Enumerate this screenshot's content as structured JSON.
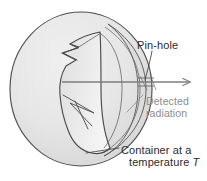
{
  "figure": {
    "kind": "cavity-radiator-blackbody-diagram",
    "width": 207,
    "height": 181,
    "background_color": "#ffffff"
  },
  "labels": {
    "pinhole": "Pin-hole",
    "detected_line1": "Detected",
    "detected_line2": "radiation",
    "container_line1": "Container at a",
    "container_line2_prefix": "temperature ",
    "container_line2_symbol": "T"
  },
  "colors": {
    "sphere_fill": "#e3e3e3",
    "sphere_fill_light": "#ededed",
    "cavity_fill": "#f2f2f2",
    "outline": "#4a4a4a",
    "outline_soft": "#6e6e6e",
    "ray": "#7d7d7d",
    "label_dark": "#2b2b2b",
    "label_gray": "#8c8c8c",
    "leader": "#3c3c3c"
  },
  "geometry": {
    "sphere_center_x": 81,
    "sphere_center_y": 89,
    "sphere_radius_x": 71,
    "sphere_radius_y": 77,
    "ray_start_x": 62,
    "ray_start_y": 82,
    "ray_end_x": 193,
    "ray_end_y": 82,
    "pinhole_x": 148,
    "pinhole_y": 82
  },
  "icons": {
    "ray_arrow": "arrow-right-icon",
    "pinhole_leader": "leader-line-icon",
    "container_leader": "leader-line-icon"
  }
}
